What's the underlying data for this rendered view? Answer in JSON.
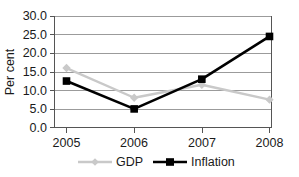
{
  "chart_data": {
    "type": "line",
    "title": "",
    "xlabel": "",
    "ylabel": "Per cent",
    "categories": [
      "2005",
      "2006",
      "2007",
      "2008"
    ],
    "x": [
      2005,
      2006,
      2007,
      2008
    ],
    "ylim": [
      0.0,
      30.0
    ],
    "ytick_step": 5.0,
    "ytick_labels": [
      "0.0",
      "5.0",
      "10.0",
      "15.0",
      "20.0",
      "25.0",
      "30.0"
    ],
    "ytick_values": [
      0.0,
      5.0,
      10.0,
      15.0,
      20.0,
      25.0,
      30.0
    ],
    "grid": true,
    "grid_axis": "y",
    "legend_position": "bottom",
    "series": [
      {
        "name": "GDP",
        "values": [
          16.0,
          8.0,
          11.5,
          7.5
        ],
        "color": "#c9c9c9",
        "marker": "diamond"
      },
      {
        "name": "Inflation",
        "values": [
          12.5,
          5.0,
          13.0,
          24.5
        ],
        "color": "#000000",
        "marker": "square"
      }
    ]
  },
  "axes": {
    "y_title": "Per cent",
    "y_labels": [
      "30.0",
      "25.0",
      "20.0",
      "15.0",
      "10.0",
      "5.0",
      "0.0"
    ],
    "x_labels": [
      "2005",
      "2006",
      "2007",
      "2008"
    ]
  },
  "legend": {
    "items": [
      {
        "label": "GDP",
        "color": "#c9c9c9",
        "marker": "diamond"
      },
      {
        "label": "Inflation",
        "color": "#000000",
        "marker": "square"
      }
    ]
  },
  "colors": {
    "gdp": "#c9c9c9",
    "inflation": "#000000",
    "grid": "#9b9b9b",
    "axis": "#555555",
    "text": "#1a1a1a",
    "background": "#ffffff"
  }
}
